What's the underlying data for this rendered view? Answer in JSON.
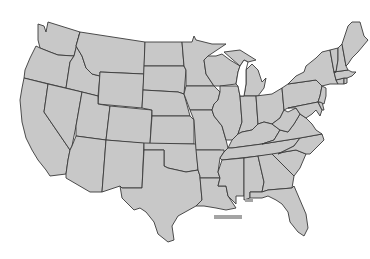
{
  "map": {
    "title": "",
    "subject": "Contiguous United States blank outline map",
    "fill_color": "#c8c8c8",
    "border_color": "#3a3a3a",
    "background_color": "#ffffff",
    "labels_visible": false,
    "marker": {
      "shape": "horizontal bar",
      "color": "#a4a4a4",
      "position": "below Louisiana coast"
    },
    "states": [
      "WA",
      "OR",
      "CA",
      "ID",
      "NV",
      "MT",
      "WY",
      "UT",
      "AZ",
      "CO",
      "NM",
      "ND",
      "SD",
      "NE",
      "KS",
      "OK",
      "TX",
      "MN",
      "IA",
      "MO",
      "AR",
      "LA",
      "WI",
      "IL",
      "MS",
      "MI",
      "IN",
      "KY",
      "TN",
      "AL",
      "OH",
      "GA",
      "FL",
      "SC",
      "NC",
      "VA",
      "WV",
      "PA",
      "NY",
      "MD",
      "DE",
      "NJ",
      "CT",
      "RI",
      "MA",
      "VT",
      "NH",
      "ME"
    ]
  }
}
